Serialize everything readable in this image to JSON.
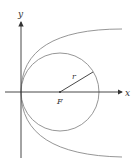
{
  "diagram": {
    "labels": {
      "y_axis": "y",
      "x_axis": "x",
      "radius": "r",
      "center": "F"
    },
    "colors": {
      "axis": "#333333",
      "curve": "#888888",
      "radius": "#333333"
    },
    "elements": [
      {
        "type": "axis",
        "name": "x-axis"
      },
      {
        "type": "axis",
        "name": "y-axis"
      },
      {
        "type": "circle",
        "name": "circle",
        "center_label": "F",
        "radius_label": "r"
      },
      {
        "type": "parabola",
        "name": "parabola",
        "opens": "right",
        "vertex": "origin"
      }
    ]
  }
}
